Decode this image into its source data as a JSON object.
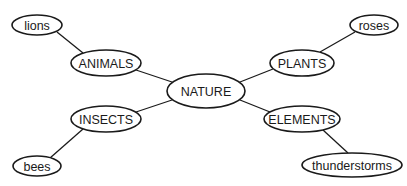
{
  "diagram": {
    "type": "mind-map",
    "center": "NATURE",
    "nodes": [
      {
        "id": "nature",
        "label": "NATURE",
        "cx": 206,
        "cy": 91,
        "rx": 39,
        "ry": 17
      },
      {
        "id": "animals",
        "label": "ANIMALS",
        "cx": 106,
        "cy": 63,
        "rx": 35,
        "ry": 13
      },
      {
        "id": "plants",
        "label": "PLANTS",
        "cx": 302,
        "cy": 63,
        "rx": 32,
        "ry": 13
      },
      {
        "id": "insects",
        "label": "INSECTS",
        "cx": 106,
        "cy": 119,
        "rx": 35,
        "ry": 13
      },
      {
        "id": "elements",
        "label": "ELEMENTS",
        "cx": 302,
        "cy": 119,
        "rx": 38,
        "ry": 13
      },
      {
        "id": "lions",
        "label": "lions",
        "cx": 37,
        "cy": 25,
        "rx": 25,
        "ry": 10
      },
      {
        "id": "roses",
        "label": "roses",
        "cx": 374,
        "cy": 25,
        "rx": 24,
        "ry": 10
      },
      {
        "id": "bees",
        "label": "bees",
        "cx": 37,
        "cy": 166,
        "rx": 24,
        "ry": 10
      },
      {
        "id": "thunderstorms",
        "label": "thunderstorms",
        "cx": 352,
        "cy": 165,
        "rx": 50,
        "ry": 12
      }
    ],
    "edges": [
      {
        "from": "nature",
        "to": "animals",
        "x1": 172,
        "y1": 82,
        "x2": 136,
        "y2": 70
      },
      {
        "from": "nature",
        "to": "plants",
        "x1": 240,
        "y1": 82,
        "x2": 273,
        "y2": 69
      },
      {
        "from": "nature",
        "to": "insects",
        "x1": 172,
        "y1": 100,
        "x2": 136,
        "y2": 112
      },
      {
        "from": "nature",
        "to": "elements",
        "x1": 240,
        "y1": 100,
        "x2": 270,
        "y2": 112
      },
      {
        "from": "animals",
        "to": "lions",
        "x1": 83,
        "y1": 53,
        "x2": 57,
        "y2": 32
      },
      {
        "from": "plants",
        "to": "roses",
        "x1": 320,
        "y1": 52,
        "x2": 355,
        "y2": 32
      },
      {
        "from": "insects",
        "to": "bees",
        "x1": 83,
        "y1": 129,
        "x2": 50,
        "y2": 158
      },
      {
        "from": "elements",
        "to": "thunderstorms",
        "x1": 323,
        "y1": 130,
        "x2": 348,
        "y2": 153
      }
    ]
  }
}
